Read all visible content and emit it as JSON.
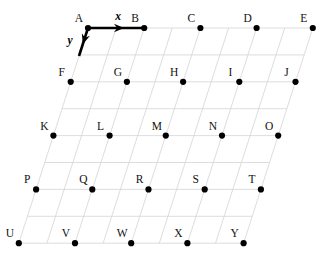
{
  "figure": {
    "title": "",
    "background_color": "#ffffff",
    "width": 326,
    "height": 258
  },
  "lattice": {
    "description": "Oblique (skewed) point lattice of 25 labelled points arranged in 5 rows and 5 columns, drawn over a faint parallelogram grid subdivided twice per lattice step.",
    "rows": 5,
    "columns": 5,
    "subdivisions_per_cell": 2,
    "grid_color": "#d4d4d4",
    "dot_color": "#000000",
    "dot_radius": 3.1,
    "origin": {
      "x": 88,
      "y": 28
    },
    "step_x": {
      "dx": 56.2,
      "dy": 0
    },
    "step_y": {
      "dx": -17.3,
      "dy": 53.8
    },
    "points": [
      {
        "label": "A",
        "col": 0,
        "row": 0
      },
      {
        "label": "B",
        "col": 1,
        "row": 0
      },
      {
        "label": "C",
        "col": 2,
        "row": 0
      },
      {
        "label": "D",
        "col": 3,
        "row": 0
      },
      {
        "label": "E",
        "col": 4,
        "row": 0
      },
      {
        "label": "F",
        "col": 0,
        "row": 1
      },
      {
        "label": "G",
        "col": 1,
        "row": 1
      },
      {
        "label": "H",
        "col": 2,
        "row": 1
      },
      {
        "label": "I",
        "col": 3,
        "row": 1
      },
      {
        "label": "J",
        "col": 4,
        "row": 1
      },
      {
        "label": "K",
        "col": 0,
        "row": 2
      },
      {
        "label": "L",
        "col": 1,
        "row": 2
      },
      {
        "label": "M",
        "col": 2,
        "row": 2
      },
      {
        "label": "N",
        "col": 3,
        "row": 2
      },
      {
        "label": "O",
        "col": 4,
        "row": 2
      },
      {
        "label": "P",
        "col": 0,
        "row": 3
      },
      {
        "label": "Q",
        "col": 1,
        "row": 3
      },
      {
        "label": "R",
        "col": 2,
        "row": 3
      },
      {
        "label": "S",
        "col": 3,
        "row": 3
      },
      {
        "label": "T",
        "col": 4,
        "row": 3
      },
      {
        "label": "U",
        "col": 0,
        "row": 4
      },
      {
        "label": "V",
        "col": 1,
        "row": 4
      },
      {
        "label": "W",
        "col": 2,
        "row": 4
      },
      {
        "label": "X",
        "col": 3,
        "row": 4
      },
      {
        "label": "Y",
        "col": 4,
        "row": 4
      }
    ],
    "label_offset": {
      "dx": -9,
      "dy": -6
    }
  },
  "basis_vectors": {
    "color": "#000000",
    "x": {
      "label": "x",
      "from_point": "A",
      "to_point": "B",
      "label_position": {
        "x": 118,
        "y": 20
      }
    },
    "y": {
      "label": "y",
      "from_point": "A",
      "toward": "F",
      "label_position": {
        "x": 70,
        "y": 44
      }
    }
  }
}
